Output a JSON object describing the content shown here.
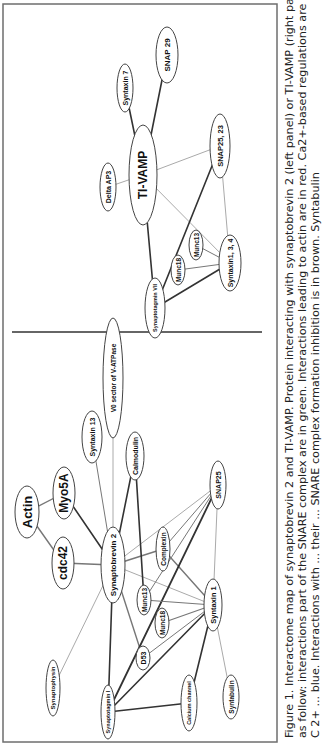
{
  "figure": {
    "caption_lines": [
      "Figure 1. Interactome map of synaptobrevin 2 and TI-VAMP. Protein interacting with synaptobrevin 2 (left panel) or TI-VAMP (right panel) are classified",
      "as follow: interactions part of the SNARE complex are in green. Interactions leading to actin are in red. Ca2+-based regulations are in sea-blue, while",
      "C 2+ ... blue. Interactions with ... their ... SNARE complex formation inhibition is in brown. Syntabulin"
    ],
    "colors": {
      "frame": "#6e6e6e",
      "divider": "#333333",
      "edge_dark": "#333333",
      "edge_mid": "#777777",
      "edge_light": "#aaaaaa",
      "node_stroke": "#444444",
      "background": "#ffffff"
    },
    "left_panel": {
      "title": "Synaptobrevin 2 interactome",
      "hub": "Synaptobrevin 2",
      "nodes": [
        {
          "id": "vatpase",
          "label": "V0 sector of V-ATPase",
          "x": 368,
          "y": 113,
          "rx": 60,
          "ry": 10,
          "fs": 6.5
        },
        {
          "id": "stx13",
          "label": "Syntaxin 13",
          "x": 309,
          "y": 92,
          "rx": 26,
          "ry": 10,
          "fs": 7
        },
        {
          "id": "calmodulin",
          "label": "Calmodulin",
          "x": 290,
          "y": 135,
          "rx": 24,
          "ry": 9,
          "fs": 7
        },
        {
          "id": "snap25",
          "label": "SNAP25",
          "x": 261,
          "y": 218,
          "rx": 24,
          "ry": 8,
          "fs": 7
        },
        {
          "id": "myo5a",
          "label": "Myo5A",
          "x": 253,
          "y": 64,
          "rx": 26,
          "ry": 11,
          "fs": 12
        },
        {
          "id": "actin",
          "label": "Actin",
          "x": 234,
          "y": 27,
          "rx": 26,
          "ry": 12,
          "fs": 13
        },
        {
          "id": "cdc42",
          "label": "cdc42",
          "x": 183,
          "y": 63,
          "rx": 26,
          "ry": 11,
          "fs": 12
        },
        {
          "id": "syb2",
          "label": "Synaptobrevin 2",
          "x": 181,
          "y": 113,
          "rx": 38,
          "ry": 12,
          "fs": 8
        },
        {
          "id": "complexin",
          "label": "Complexin",
          "x": 197,
          "y": 163,
          "rx": 22,
          "ry": 7,
          "fs": 6.5
        },
        {
          "id": "munc13a",
          "label": "Munc13",
          "x": 146,
          "y": 144,
          "rx": 15,
          "ry": 7,
          "fs": 6.5
        },
        {
          "id": "munc18a",
          "label": "Munc18",
          "x": 123,
          "y": 162,
          "rx": 15,
          "ry": 7,
          "fs": 6.5
        },
        {
          "id": "stx1",
          "label": "Syntaxin 1",
          "x": 141,
          "y": 213,
          "rx": 26,
          "ry": 9,
          "fs": 7.5
        },
        {
          "id": "d53",
          "label": "D53",
          "x": 88,
          "y": 143,
          "rx": 12,
          "ry": 7,
          "fs": 7
        },
        {
          "id": "synaptophysin",
          "label": "Synaptophysin",
          "x": 58,
          "y": 53,
          "rx": 28,
          "ry": 7,
          "fs": 6
        },
        {
          "id": "syt1",
          "label": "Synaptotagmin I",
          "x": 34,
          "y": 108,
          "rx": 27,
          "ry": 7,
          "fs": 5.5
        },
        {
          "id": "cachannel",
          "label": "Calcium channel",
          "x": 43,
          "y": 189,
          "rx": 28,
          "ry": 8,
          "fs": 5.5
        },
        {
          "id": "syntabulin",
          "label": "Syntabulin",
          "x": 49,
          "y": 231,
          "rx": 22,
          "ry": 8,
          "fs": 6.5
        }
      ],
      "edges": [
        {
          "from": "syb2",
          "to": "vatpase",
          "w": 1,
          "tone": "edge_light"
        },
        {
          "from": "syb2",
          "to": "stx13",
          "w": 1,
          "tone": "edge_mid"
        },
        {
          "from": "syb2",
          "to": "calmodulin",
          "w": 1.6,
          "tone": "edge_dark"
        },
        {
          "from": "syb2",
          "to": "snap25",
          "w": 1,
          "tone": "edge_light"
        },
        {
          "from": "syb2",
          "to": "myo5a",
          "w": 1.6,
          "tone": "edge_dark"
        },
        {
          "from": "actin",
          "to": "myo5a",
          "w": 1.4,
          "tone": "edge_mid"
        },
        {
          "from": "actin",
          "to": "cdc42",
          "w": 1.4,
          "tone": "edge_mid"
        },
        {
          "from": "syb2",
          "to": "cdc42",
          "w": 1.4,
          "tone": "edge_mid"
        },
        {
          "from": "syb2",
          "to": "complexin",
          "w": 1.4,
          "tone": "edge_mid"
        },
        {
          "from": "syb2",
          "to": "stx1",
          "w": 1,
          "tone": "edge_light"
        },
        {
          "from": "syb2",
          "to": "d53",
          "w": 1.4,
          "tone": "edge_mid"
        },
        {
          "from": "syb2",
          "to": "synaptophysin",
          "w": 1,
          "tone": "edge_light"
        },
        {
          "from": "syb2",
          "to": "syt1",
          "w": 1.6,
          "tone": "edge_dark"
        },
        {
          "from": "calmodulin",
          "to": "munc13a",
          "w": 1.6,
          "tone": "edge_dark"
        },
        {
          "from": "complexin",
          "to": "snap25",
          "w": 1,
          "tone": "edge_mid"
        },
        {
          "from": "complexin",
          "to": "stx1",
          "w": 1.4,
          "tone": "edge_mid"
        },
        {
          "from": "snap25",
          "to": "stx1",
          "w": 1,
          "tone": "edge_light"
        },
        {
          "from": "snap25",
          "to": "syt1",
          "w": 1.8,
          "tone": "edge_dark"
        },
        {
          "from": "snap25",
          "to": "munc13a",
          "w": 1,
          "tone": "edge_mid"
        },
        {
          "from": "munc13a",
          "to": "stx1",
          "w": 1.2,
          "tone": "edge_mid"
        },
        {
          "from": "munc18a",
          "to": "stx1",
          "w": 1.2,
          "tone": "edge_mid"
        },
        {
          "from": "d53",
          "to": "stx1",
          "w": 1,
          "tone": "edge_mid"
        },
        {
          "from": "syt1",
          "to": "stx1",
          "w": 1.6,
          "tone": "edge_dark"
        },
        {
          "from": "syt1",
          "to": "cachannel",
          "w": 1.6,
          "tone": "edge_dark"
        },
        {
          "from": "cachannel",
          "to": "stx1",
          "w": 1.6,
          "tone": "edge_dark"
        },
        {
          "from": "syntabulin",
          "to": "stx1",
          "w": 1,
          "tone": "edge_light"
        }
      ]
    },
    "right_panel": {
      "title": "TI-VAMP interactome",
      "hub": "TI-VAMP",
      "nodes": [
        {
          "id": "tivamp",
          "label": "TI-VAMP",
          "x": 571,
          "y": 143,
          "rx": 50,
          "ry": 14,
          "fs": 12
        },
        {
          "id": "deltaap3",
          "label": "Delta AP3",
          "x": 559,
          "y": 108,
          "rx": 24,
          "ry": 8,
          "fs": 7
        },
        {
          "id": "stx7",
          "label": "Syntaxin 7",
          "x": 658,
          "y": 125,
          "rx": 24,
          "ry": 8,
          "fs": 7
        },
        {
          "id": "snap29",
          "label": "SNAP 29",
          "x": 691,
          "y": 167,
          "rx": 28,
          "ry": 11,
          "fs": 8
        },
        {
          "id": "snap2523",
          "label": "SNAP25, 23",
          "x": 600,
          "y": 220,
          "rx": 32,
          "ry": 10,
          "fs": 7.5
        },
        {
          "id": "munc13b",
          "label": "Munc13",
          "x": 501,
          "y": 196,
          "rx": 15,
          "ry": 7,
          "fs": 6.5
        },
        {
          "id": "munc18b",
          "label": "Munc18",
          "x": 476,
          "y": 178,
          "rx": 15,
          "ry": 7,
          "fs": 6.5
        },
        {
          "id": "stx134",
          "label": "Syntaxin1, 3, 4",
          "x": 483,
          "y": 230,
          "rx": 28,
          "ry": 11,
          "fs": 7
        },
        {
          "id": "syt7",
          "label": "Synaptotagmin VII",
          "x": 438,
          "y": 155,
          "rx": 30,
          "ry": 10,
          "fs": 5.5
        }
      ],
      "edges": [
        {
          "from": "tivamp",
          "to": "deltaap3",
          "w": 1,
          "tone": "edge_light"
        },
        {
          "from": "tivamp",
          "to": "stx7",
          "w": 1.6,
          "tone": "edge_dark"
        },
        {
          "from": "tivamp",
          "to": "snap29",
          "w": 1.6,
          "tone": "edge_dark"
        },
        {
          "from": "tivamp",
          "to": "snap2523",
          "w": 1,
          "tone": "edge_light"
        },
        {
          "from": "tivamp",
          "to": "stx134",
          "w": 1,
          "tone": "edge_light"
        },
        {
          "from": "tivamp",
          "to": "syt7",
          "w": 1.6,
          "tone": "edge_dark"
        },
        {
          "from": "snap2523",
          "to": "syt7",
          "w": 1.6,
          "tone": "edge_dark"
        },
        {
          "from": "snap2523",
          "to": "stx134",
          "w": 1,
          "tone": "edge_light"
        },
        {
          "from": "munc13b",
          "to": "stx134",
          "w": 1,
          "tone": "edge_mid"
        },
        {
          "from": "munc18b",
          "to": "stx134",
          "w": 1,
          "tone": "edge_mid"
        },
        {
          "from": "syt7",
          "to": "stx134",
          "w": 1.6,
          "tone": "edge_dark"
        }
      ]
    },
    "frame": {
      "x": 4,
      "y": 3,
      "w": 738,
      "h": 274
    },
    "divider": {
      "x": 414,
      "y1": 12,
      "y2": 262
    }
  }
}
